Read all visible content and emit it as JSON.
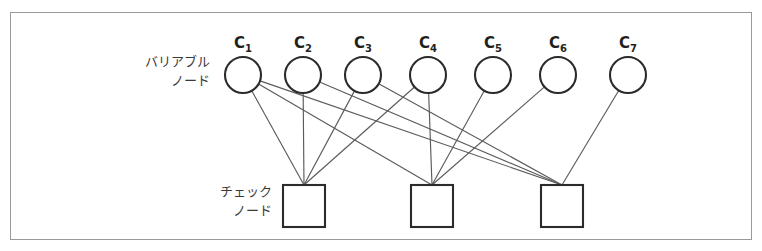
{
  "figure": {
    "type": "tanner-graph",
    "background_color": "#ffffff",
    "frame_color": "#9a9a9a",
    "node_stroke_color": "#2b2b2b",
    "edge_color": "#5b5b5b"
  },
  "labels": {
    "variable_node_line1": "バリアブル",
    "variable_node_line2": "ノード",
    "check_node_line1": "チェック",
    "check_node_line2": "ノード"
  },
  "variable_nodes": [
    {
      "id": "c1",
      "base": "C",
      "sub": "1",
      "cx": 243,
      "cy": 75,
      "r": 18
    },
    {
      "id": "c2",
      "base": "C",
      "sub": "2",
      "cx": 303,
      "cy": 75,
      "r": 18
    },
    {
      "id": "c3",
      "base": "C",
      "sub": "3",
      "cx": 363,
      "cy": 75,
      "r": 18
    },
    {
      "id": "c4",
      "base": "C",
      "sub": "4",
      "cx": 428,
      "cy": 75,
      "r": 18
    },
    {
      "id": "c5",
      "base": "C",
      "sub": "5",
      "cx": 493,
      "cy": 75,
      "r": 18
    },
    {
      "id": "c6",
      "base": "C",
      "sub": "6",
      "cx": 558,
      "cy": 75,
      "r": 18
    },
    {
      "id": "c7",
      "base": "C",
      "sub": "7",
      "cx": 628,
      "cy": 75,
      "r": 18
    }
  ],
  "check_nodes": [
    {
      "id": "cn1",
      "x": 283,
      "y": 185,
      "size": 42
    },
    {
      "id": "cn2",
      "x": 411,
      "y": 185,
      "size": 42
    },
    {
      "id": "cn3",
      "x": 541,
      "y": 185,
      "size": 42
    }
  ],
  "edges": [
    {
      "from": "c1",
      "to": "cn1"
    },
    {
      "from": "c1",
      "to": "cn2"
    },
    {
      "from": "c1",
      "to": "cn3"
    },
    {
      "from": "c2",
      "to": "cn1"
    },
    {
      "from": "c2",
      "to": "cn3"
    },
    {
      "from": "c3",
      "to": "cn1"
    },
    {
      "from": "c3",
      "to": "cn3"
    },
    {
      "from": "c4",
      "to": "cn1"
    },
    {
      "from": "c4",
      "to": "cn2"
    },
    {
      "from": "c5",
      "to": "cn2"
    },
    {
      "from": "c6",
      "to": "cn2"
    },
    {
      "from": "c7",
      "to": "cn3"
    }
  ],
  "side_label_positions": {
    "variable": {
      "x": 210,
      "y": 66
    },
    "check": {
      "x": 272,
      "y": 196
    }
  }
}
